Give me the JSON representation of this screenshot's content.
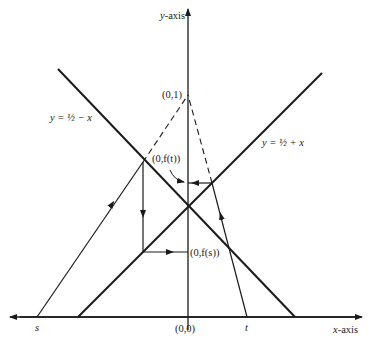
{
  "axes": {
    "y_label_var": "y",
    "y_label_rest": "-axis",
    "x_label_var": "x",
    "x_label_rest": "-axis"
  },
  "lines": {
    "left_line": "y = ½ − x",
    "right_line": "y = ½ + x"
  },
  "points": {
    "top": "(0,1)",
    "f_t": "(0,f(t))",
    "f_s": "(0,f(s))",
    "origin": "(0,0)",
    "s": "s",
    "t": "t"
  },
  "colors": {
    "ink": "#1a1a1a",
    "background": "#ffffff"
  }
}
